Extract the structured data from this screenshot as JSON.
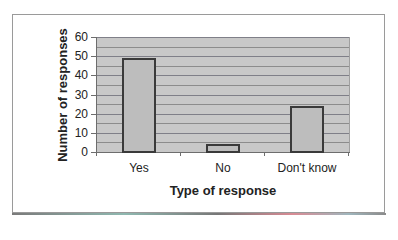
{
  "chart_data": {
    "type": "bar",
    "title": "",
    "categories": [
      "Yes",
      "No",
      "Don't know"
    ],
    "values": [
      49,
      4,
      24
    ],
    "xlabel": "Type of response",
    "ylabel": "Number of responses",
    "ylim": [
      0,
      60
    ],
    "yticks": [
      0,
      10,
      20,
      30,
      40,
      50,
      60
    ],
    "ytick_labels": [
      "0",
      "10",
      "20",
      "30",
      "40",
      "50",
      "60"
    ],
    "grid": true,
    "grid_step": 5,
    "legend": null,
    "colors": {
      "bar_fill": "#bdbdbd",
      "bar_border": "#3a3a3a",
      "plot_bg": "#c8c8c8",
      "grid": "#8c8c8c"
    }
  }
}
